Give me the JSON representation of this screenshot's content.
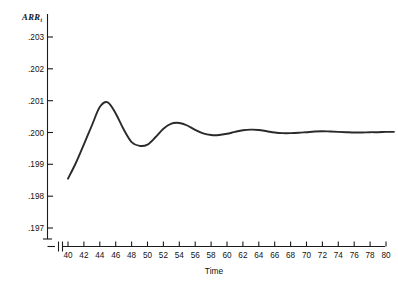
{
  "chart_data": {
    "type": "line",
    "title": "",
    "subtitle": "",
    "xlabel": "Time",
    "ylabel": "ARR",
    "ylabel_subscript": "t",
    "ylim": [
      0.197,
      0.2035
    ],
    "xlim": [
      40,
      81
    ],
    "grid": false,
    "legend": null,
    "axis_break_x": true,
    "ytick_labels": [
      ".203",
      ".202",
      ".201",
      ".200",
      ".199",
      ".198",
      ".197"
    ],
    "ytick_values": [
      0.203,
      0.202,
      0.201,
      0.2,
      0.199,
      0.198,
      0.197
    ],
    "xtick_labels": [
      "40",
      "42",
      "44",
      "46",
      "48",
      "50",
      "52",
      "54",
      "56",
      "58",
      "60",
      "62",
      "64",
      "66",
      "68",
      "70",
      "72",
      "74",
      "76",
      "78",
      "80"
    ],
    "xtick_values": [
      40,
      42,
      44,
      46,
      48,
      50,
      52,
      54,
      56,
      58,
      60,
      62,
      64,
      66,
      68,
      70,
      72,
      74,
      76,
      78,
      80
    ],
    "series": [
      {
        "name": "ARR_t",
        "color": "#2a2a2a",
        "x": [
          40,
          41,
          42,
          43,
          44,
          45,
          46,
          47,
          48,
          49,
          50,
          51,
          52,
          53,
          54,
          55,
          56,
          57,
          58,
          59,
          60,
          61,
          62,
          63,
          64,
          65,
          66,
          67,
          68,
          69,
          70,
          71,
          72,
          73,
          74,
          75,
          76,
          77,
          78,
          79,
          80,
          81
        ],
        "y": [
          0.19855,
          0.19905,
          0.19963,
          0.20022,
          0.2008,
          0.20095,
          0.2006,
          0.2001,
          0.1997,
          0.19958,
          0.19962,
          0.19985,
          0.20012,
          0.20028,
          0.2003,
          0.20022,
          0.20008,
          0.19997,
          0.19992,
          0.19992,
          0.19996,
          0.20002,
          0.20007,
          0.20009,
          0.20008,
          0.20004,
          0.2,
          0.19998,
          0.19998,
          0.19999,
          0.20001,
          0.20003,
          0.20004,
          0.20003,
          0.20002,
          0.20001,
          0.2,
          0.2,
          0.20001,
          0.20001,
          0.20002,
          0.20002
        ]
      }
    ],
    "annotations": []
  },
  "figure": {
    "y_axis_title": "ARR",
    "y_axis_title_subscript": "t",
    "x_axis_title": "Time"
  }
}
